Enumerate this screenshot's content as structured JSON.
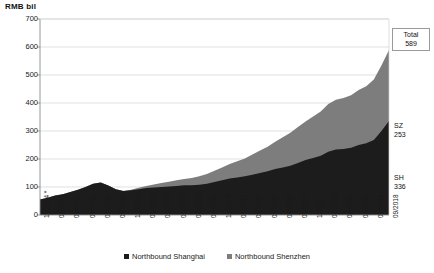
{
  "axis_unit_title": "RMB bil",
  "callouts": {
    "total": {
      "line1": "Total",
      "line2": "589"
    },
    "sz": {
      "line1": "SZ",
      "line2": "253"
    },
    "sh": {
      "line1": "SH",
      "line2": "336"
    }
  },
  "legend": {
    "items": [
      {
        "label": "Northbound Shanghai",
        "color": "#1c1c1c"
      },
      {
        "label": "Northbound Shenzhen",
        "color": "#7d7d7d"
      }
    ]
  },
  "chart_data": {
    "type": "area",
    "stacked": true,
    "title": "",
    "subtitle": "",
    "xlabel": "",
    "ylabel": "RMB bil",
    "ylim": [
      0,
      700
    ],
    "yticks": [
      0,
      100,
      200,
      300,
      400,
      500,
      600,
      700
    ],
    "grid": true,
    "legend_position": "bottom",
    "annotations": [
      {
        "text": "Total 589",
        "target": "stack-top-end"
      },
      {
        "text": "SZ 253",
        "target": "shenzhen-end"
      },
      {
        "text": "SH 336",
        "target": "shanghai-end"
      }
    ],
    "x_tick_labels": [
      "11/2014 *",
      "01/2015",
      "03/2015",
      "05/2015",
      "07/2015",
      "09/2015",
      "11/2015",
      "01/2016",
      "03/2016",
      "05/2016",
      "07/2016",
      "09/2016",
      "11/2016",
      "01/2017",
      "03/2017",
      "05/2017",
      "07/2017",
      "09/2017",
      "11/2017",
      "01/2018",
      "03/2018",
      "05/2018",
      "07/2018",
      "09/2018"
    ],
    "x": [
      "11/2014",
      "12/2014",
      "01/2015",
      "02/2015",
      "03/2015",
      "04/2015",
      "05/2015",
      "06/2015",
      "07/2015",
      "08/2015",
      "09/2015",
      "10/2015",
      "11/2015",
      "12/2015",
      "01/2016",
      "02/2016",
      "03/2016",
      "04/2016",
      "05/2016",
      "06/2016",
      "07/2016",
      "08/2016",
      "09/2016",
      "10/2016",
      "11/2016",
      "12/2016",
      "01/2017",
      "02/2017",
      "03/2017",
      "04/2017",
      "05/2017",
      "06/2017",
      "07/2017",
      "08/2017",
      "09/2017",
      "10/2017",
      "11/2017",
      "12/2017",
      "01/2018",
      "02/2018",
      "03/2018",
      "04/2018",
      "05/2018",
      "06/2018",
      "07/2018",
      "08/2018",
      "09/2018"
    ],
    "series": [
      {
        "name": "Northbound Shanghai",
        "color": "#1c1c1c",
        "values": [
          55,
          62,
          70,
          74,
          82,
          90,
          100,
          112,
          116,
          105,
          92,
          86,
          88,
          92,
          96,
          98,
          100,
          102,
          104,
          106,
          106,
          108,
          112,
          118,
          124,
          130,
          134,
          138,
          144,
          150,
          156,
          164,
          170,
          176,
          186,
          196,
          204,
          212,
          226,
          234,
          236,
          240,
          250,
          256,
          268,
          300,
          336
        ]
      },
      {
        "name": "Northbound Shenzhen",
        "color": "#7d7d7d",
        "values": [
          0,
          0,
          0,
          0,
          0,
          0,
          0,
          0,
          0,
          0,
          0,
          0,
          2,
          5,
          8,
          11,
          14,
          17,
          20,
          23,
          26,
          30,
          34,
          40,
          46,
          52,
          58,
          64,
          72,
          80,
          88,
          98,
          108,
          118,
          128,
          138,
          148,
          158,
          170,
          178,
          182,
          188,
          196,
          204,
          216,
          234,
          253
        ]
      }
    ],
    "totals_end": 589
  }
}
